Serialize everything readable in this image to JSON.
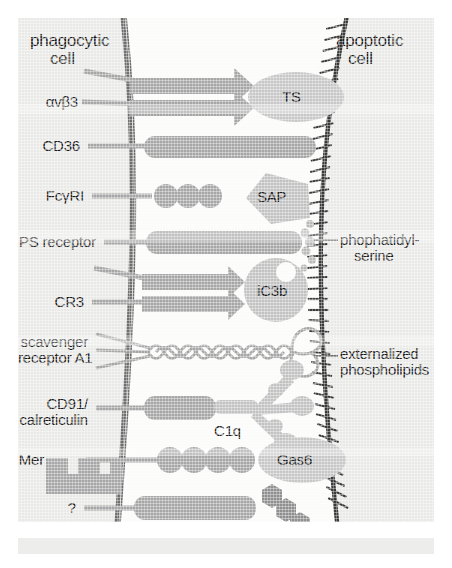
{
  "figure": {
    "type": "biology-diagram",
    "left_cell_title_line1": "phagocytic",
    "left_cell_title_line2": "cell",
    "right_cell_title_line1": "apoptotic",
    "right_cell_title_line2": "cell"
  },
  "colors": {
    "panel_background": "#e9e9e7",
    "receptor_gray": "#a6a6a6",
    "ligand_gray": "#c2c2c2",
    "membrane_line": "#6f6f6f",
    "apoptotic_membrane_line": "#3a3a3a",
    "text": "#1b1b1b",
    "leader_line": "#8a8a8a"
  },
  "receptors": [
    {
      "id": "avb3",
      "label": "αvβ3",
      "label_lines": [
        "αvβ3"
      ],
      "shape": "integrin-pair",
      "ligand": "TS"
    },
    {
      "id": "cd36",
      "label": "CD36",
      "label_lines": [
        "CD36"
      ],
      "shape": "bar",
      "ligand": "TS"
    },
    {
      "id": "fcgri",
      "label": "FcγRI",
      "label_lines": [
        "FcγRI"
      ],
      "shape": "beads-3",
      "ligand": "SAP"
    },
    {
      "id": "ps_receptor",
      "label": "PS receptor",
      "label_lines": [
        "PS receptor"
      ],
      "shape": "bar",
      "ligand": "phophatidyl-serine"
    },
    {
      "id": "cr3",
      "label": "CR3",
      "label_lines": [
        "CR3"
      ],
      "shape": "integrin-pair",
      "ligand": "iC3b"
    },
    {
      "id": "scavenger",
      "label": "scavenger receptor A1",
      "label_lines": [
        "scavenger",
        "receptor A1"
      ],
      "shape": "coiled-coil",
      "ligand": "externalized phospholipids"
    },
    {
      "id": "cd91",
      "label": "CD91/ calreticulin",
      "label_lines": [
        "CD91/",
        "calreticulin"
      ],
      "shape": "bar",
      "ligand": "C1q"
    },
    {
      "id": "mer",
      "label": "Mer",
      "label_lines": [
        "Mer"
      ],
      "shape": "beads-4-with-tail",
      "ligand": "Gas6"
    },
    {
      "id": "unknown",
      "label": "?",
      "label_lines": [
        "?"
      ],
      "shape": "bar",
      "ligand": "altered CHO"
    }
  ],
  "ligands": [
    {
      "id": "ts",
      "label": "TS",
      "shape": "ellipse"
    },
    {
      "id": "sap",
      "label": "SAP",
      "shape": "pentagon"
    },
    {
      "id": "ic3b",
      "label": "iC3b",
      "shape": "circle"
    },
    {
      "id": "c1q",
      "label": "C1q",
      "shape": "tulip-bouquet"
    },
    {
      "id": "gas6",
      "label": "Gas6",
      "shape": "ellipse"
    },
    {
      "id": "cho_bar",
      "label": "",
      "shape": "bar"
    }
  ],
  "right_annotations": [
    {
      "id": "ps",
      "lines": [
        "phophatidyl-",
        "serine"
      ]
    },
    {
      "id": "lipid",
      "lines": [
        "externalized",
        "phospholipids"
      ]
    }
  ],
  "inline_labels": [
    {
      "id": "ic3b_text",
      "text": "iC3b"
    },
    {
      "id": "c1q_text",
      "text": "C1q"
    },
    {
      "id": "gas6_text",
      "text": "Gas6"
    },
    {
      "id": "ts_text",
      "text": "TS"
    },
    {
      "id": "sap_text",
      "text": "SAP"
    },
    {
      "id": "cho_text_1",
      "text": "altered"
    },
    {
      "id": "cho_text_2",
      "text": "CHO"
    }
  ]
}
